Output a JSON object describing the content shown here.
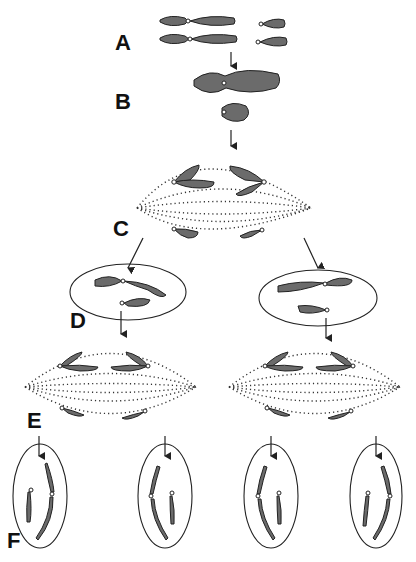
{
  "labels": {
    "A": "A",
    "B": "B",
    "C": "C",
    "D": "D",
    "E": "E",
    "F": "F"
  },
  "stages": [
    {
      "label": "A",
      "description": "Two pairs of homologous chromosomes (long and short), unpaired"
    },
    {
      "label": "B",
      "description": "Homologous chromosomes pair up and cross over (synapsis)"
    },
    {
      "label": "C",
      "description": "Homologous pairs separate on a spindle (anaphase I)"
    },
    {
      "label": "D",
      "description": "Two daughter cells, each with one long and one short chromosome"
    },
    {
      "label": "E",
      "description": "Sister chromatids separate on spindles (anaphase II)"
    },
    {
      "label": "F",
      "description": "Four haploid cells, each with one long and one short chromatid"
    }
  ],
  "colors": {
    "chromosome_fill": "#6b6b6b",
    "chromosome_stroke": "#222222",
    "line": "#222222",
    "background": "#ffffff"
  }
}
